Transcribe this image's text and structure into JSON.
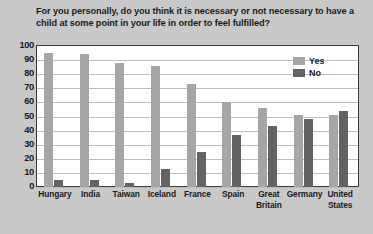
{
  "chart_data": {
    "type": "bar",
    "title": "For you personally, do you think it is necessary or not necessary to have a child at some point in your life in order to feel fulfilled?",
    "xlabel": "",
    "ylabel": "",
    "ylim": [
      0,
      100
    ],
    "ytick_step": 10,
    "yticks": [
      "100",
      "90",
      "80",
      "70",
      "60",
      "50",
      "40",
      "30",
      "20",
      "10",
      "0"
    ],
    "grid": true,
    "legend_position": "top-right",
    "categories": [
      "Hungary",
      "India",
      "Taiwan",
      "Iceland",
      "France",
      "Spain",
      "Great Britain",
      "Germany",
      "United States"
    ],
    "series": [
      {
        "name": "Yes",
        "color": "#a6a6a6",
        "values": [
          95,
          94,
          88,
          86,
          73,
          60,
          56,
          51,
          51
        ]
      },
      {
        "name": "No",
        "color": "#636363",
        "values": [
          5,
          5,
          3,
          13,
          25,
          37,
          43,
          48,
          54
        ]
      }
    ]
  },
  "legend": {
    "items": [
      {
        "label": "Yes",
        "color": "#a6a6a6"
      },
      {
        "label": "No",
        "color": "#636363"
      }
    ]
  },
  "colors": {
    "background": "#c9c9c9",
    "plot_background": "#ffffff",
    "axis": "#3a3a3a",
    "gridline": "#bdbdbd",
    "text": "#1a1a1a",
    "yes": "#a6a6a6",
    "no": "#636363"
  }
}
